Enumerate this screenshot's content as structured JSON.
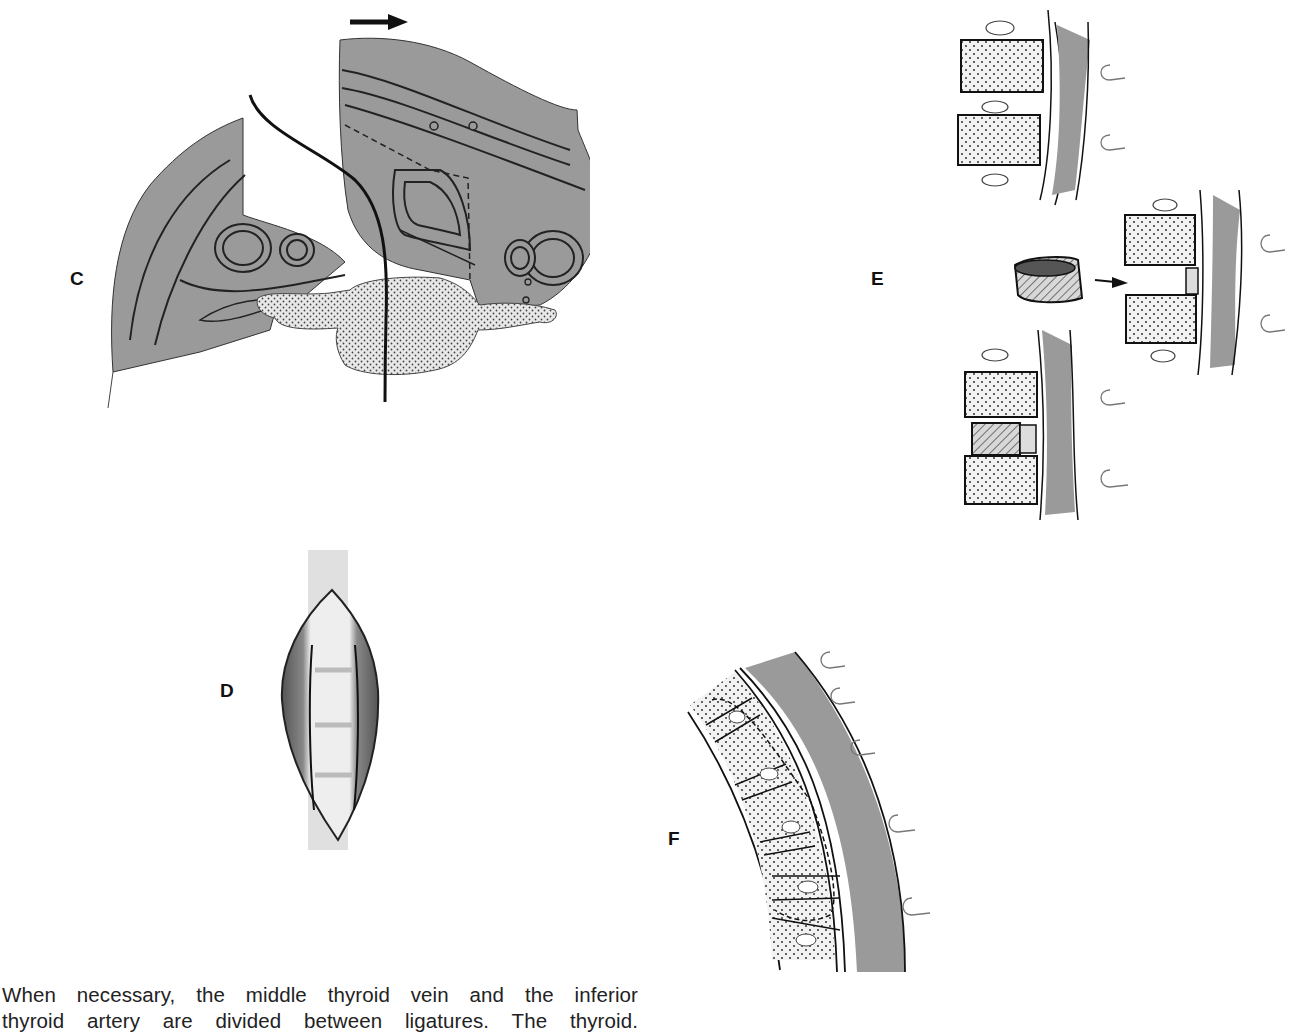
{
  "figure": {
    "panels": [
      {
        "id": "C",
        "label": "C",
        "description": "Cross-section of neck showing retraction of carotid sheath and approach to vertebral body; arrow indicates direction of retraction"
      },
      {
        "id": "D",
        "label": "D",
        "description": "Exposed anterior cervical spine through incision"
      },
      {
        "id": "E",
        "label": "E",
        "description": "Vertebral bone graft insertion into intervertebral space"
      },
      {
        "id": "F",
        "label": "F",
        "description": "Curved spine segment with dashed outline of resection area"
      }
    ],
    "colors": {
      "tissue_gray": "#9a9a9a",
      "line": "#1a1a1a",
      "stipple_bg": "#e6e6e6"
    }
  },
  "caption": {
    "line1": "When necessary, the middle thyroid vein and the inferior",
    "line2": "thyroid artery are divided between ligatures. The thyroid."
  }
}
